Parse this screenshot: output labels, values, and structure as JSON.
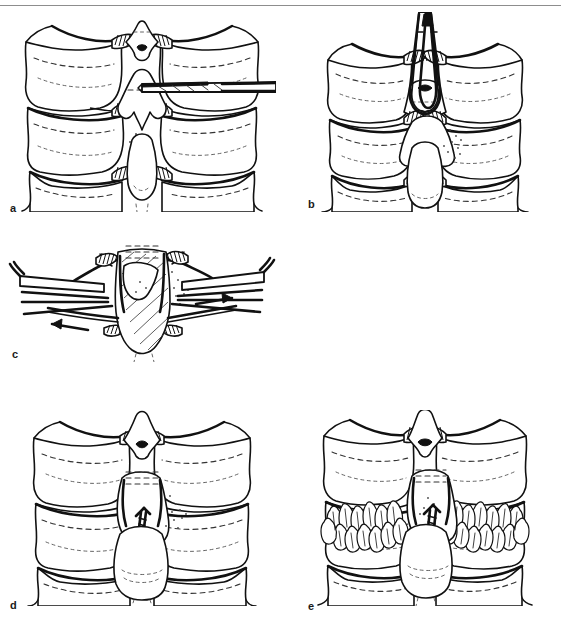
{
  "figure": {
    "kind": "medical-line-illustration",
    "panel_count": 5,
    "background_color": "#ffffff",
    "ink_color": "#111111",
    "rule_color": "#8d8d8d",
    "panels": [
      {
        "id": "a",
        "label": "a",
        "caption_text": "",
        "description": "Posterior view of three cervical vertebrae; a drill/bur is passed transversely through the base of the spinous process from the right side.",
        "instruments": [
          "drill-bit",
          "bur-shaft"
        ],
        "anatomy": [
          "vertebra-upper",
          "vertebra-middle",
          "vertebra-lower",
          "spinous-process",
          "lamina",
          "facet-joint"
        ],
        "instrument_entry_side": "right"
      },
      {
        "id": "b",
        "label": "b",
        "caption_text": "",
        "description": "Towel clip or bone-holding forceps grasps the spinous process of the middle vertebra from above.",
        "instruments": [
          "bone-holding-forceps"
        ],
        "anatomy": [
          "vertebra-upper",
          "vertebra-middle",
          "vertebra-lower",
          "spinous-process",
          "facet-joint"
        ],
        "instrument_entry_side": "superior"
      },
      {
        "id": "c",
        "label": "c",
        "caption_text": "",
        "description": "Close-up: wires are passed through the drill holes and pulled laterally in opposite directions with wire holders; arrows show direction of traction.",
        "instruments": [
          "wire-holder-left",
          "wire-holder-right",
          "wire-left",
          "wire-right"
        ],
        "anatomy": [
          "spinous-process",
          "lamina"
        ],
        "arrows": [
          {
            "id": "arrow-left",
            "direction": "left",
            "meaning": "traction-left"
          },
          {
            "id": "arrow-right",
            "direction": "right",
            "meaning": "traction-right"
          }
        ]
      },
      {
        "id": "d",
        "label": "d",
        "caption_text": "",
        "description": "Wire is tightened and twisted between the spinous processes, completing the interspinous fixation.",
        "instruments": [
          "twisted-wire"
        ],
        "anatomy": [
          "vertebra-upper",
          "vertebra-middle",
          "vertebra-lower",
          "spinous-process"
        ]
      },
      {
        "id": "e",
        "label": "e",
        "caption_text": "",
        "description": "Cancellous bone graft chips are packed bilaterally over the decorticated laminae alongside the twisted wire.",
        "instruments": [
          "twisted-wire"
        ],
        "anatomy": [
          "vertebra-upper",
          "vertebra-middle",
          "vertebra-lower",
          "spinous-process",
          "bone-graft-left",
          "bone-graft-right"
        ]
      }
    ]
  }
}
